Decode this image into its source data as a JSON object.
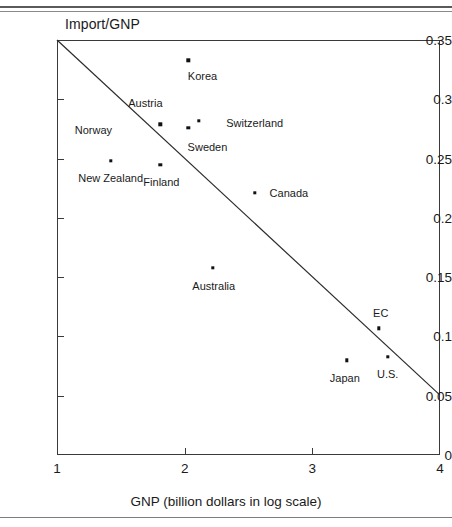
{
  "figure": {
    "y_axis_title": "Import/GNP",
    "x_axis_title": "GNP (billion dollars in log scale)"
  },
  "chart_data": {
    "type": "scatter",
    "title": "",
    "xlabel": "GNP (billion dollars in log scale)",
    "ylabel": "Import/GNP",
    "xlim": [
      1,
      4
    ],
    "ylim": [
      0,
      0.35
    ],
    "xticks": [
      1,
      2,
      3,
      4
    ],
    "xtick_labels": [
      "1",
      "2",
      "3",
      "4"
    ],
    "yticks": [
      0,
      0.05,
      0.1,
      0.15,
      0.2,
      0.25,
      0.3,
      0.35
    ],
    "ytick_labels": [
      "0",
      "0.05",
      "0.1",
      "0.15",
      "0.2",
      "0.25",
      "0.3",
      "0.35"
    ],
    "grid": false,
    "legend": "none",
    "points": [
      {
        "label": "Korea",
        "x": 2.03,
        "y": 0.333,
        "label_dx": 14,
        "label_dy": 16
      },
      {
        "label": "Austria",
        "x": 1.81,
        "y": 0.279,
        "label_dx": -15,
        "label_dy": -21
      },
      {
        "label": "Switzerland",
        "x": 2.11,
        "y": 0.282,
        "label_dx": 56,
        "label_dy": 2
      },
      {
        "label": "Sweden",
        "x": 2.03,
        "y": 0.276,
        "label_dx": 19,
        "label_dy": 19
      },
      {
        "label": "Norway",
        "x": 1.81,
        "y": 0.279,
        "label_dx": -67,
        "label_dy": 6,
        "hide_point": true
      },
      {
        "label": "New Zealand",
        "x": 1.42,
        "y": 0.248,
        "label_dx": 0,
        "label_dy": 17
      },
      {
        "label": "Finland",
        "x": 1.81,
        "y": 0.245,
        "label_dx": 1,
        "label_dy": 17
      },
      {
        "label": "Canada",
        "x": 2.55,
        "y": 0.221,
        "label_dx": 34,
        "label_dy": 0
      },
      {
        "label": "Australia",
        "x": 2.22,
        "y": 0.158,
        "label_dx": 1,
        "label_dy": 18
      },
      {
        "label": "EC",
        "x": 3.52,
        "y": 0.107,
        "label_dx": 2,
        "label_dy": -15
      },
      {
        "label": "U.S.",
        "x": 3.59,
        "y": 0.083,
        "label_dx": 0,
        "label_dy": 17
      },
      {
        "label": "Japan",
        "x": 3.27,
        "y": 0.08,
        "label_dx": -2,
        "label_dy": 18
      }
    ],
    "trend_line": {
      "x0": 1.0,
      "y0": 0.35,
      "x1": 4.0,
      "y1": 0.0505
    },
    "axis_colors": {
      "frame": "#3a3a3a",
      "point": "#111111",
      "trend": "#2b2b2b"
    }
  }
}
